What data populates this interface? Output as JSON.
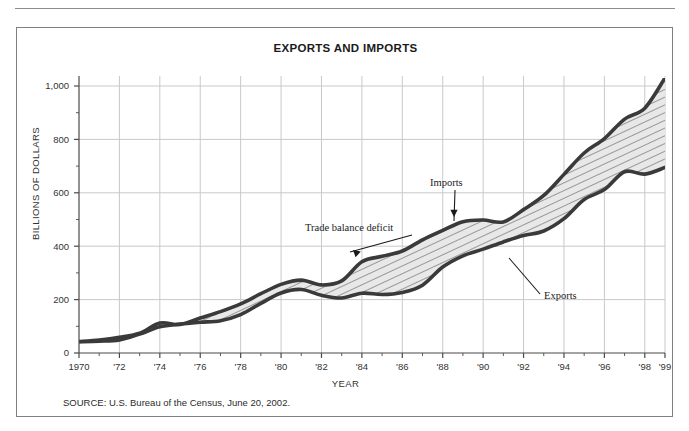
{
  "figure": {
    "title": "EXPORTS AND IMPORTS",
    "source_note": "SOURCE: U.S. Bureau of the Census, June 20, 2002."
  },
  "chart_data": {
    "type": "area",
    "title": "EXPORTS AND IMPORTS",
    "xlabel": "YEAR",
    "ylabel": "BILLIONS OF DOLLARS",
    "xlim": [
      1970,
      1999
    ],
    "ylim": [
      0,
      1000
    ],
    "grid": true,
    "legend_position": "inline-annotations",
    "x_tick_labels": [
      "1970",
      "'72",
      "'74",
      "'76",
      "'78",
      "'80",
      "'82",
      "'84",
      "'86",
      "'88",
      "'90",
      "'92",
      "'94",
      "'96",
      "'98",
      "'99"
    ],
    "x_tick_values": [
      1970,
      1972,
      1974,
      1976,
      1978,
      1980,
      1982,
      1984,
      1986,
      1988,
      1990,
      1992,
      1994,
      1996,
      1998,
      1999
    ],
    "y_tick_labels": [
      "0",
      "200",
      "400",
      "600",
      "800",
      "1,000"
    ],
    "y_tick_values": [
      0,
      200,
      400,
      600,
      800,
      1000
    ],
    "x": [
      1970,
      1971,
      1972,
      1973,
      1974,
      1975,
      1976,
      1977,
      1978,
      1979,
      1980,
      1981,
      1982,
      1983,
      1984,
      1985,
      1986,
      1987,
      1988,
      1989,
      1990,
      1991,
      1992,
      1993,
      1994,
      1995,
      1996,
      1997,
      1998,
      1999
    ],
    "series": [
      {
        "name": "Imports",
        "color": "#3a3a3a",
        "values": [
          43,
          49,
          59,
          74,
          112,
          107,
          131,
          155,
          184,
          222,
          257,
          273,
          255,
          270,
          342,
          362,
          382,
          424,
          459,
          492,
          498,
          491,
          537,
          590,
          669,
          749,
          803,
          876,
          917,
          1030
        ]
      },
      {
        "name": "Exports",
        "color": "#3a3a3a",
        "values": [
          42,
          44,
          49,
          71,
          98,
          108,
          115,
          121,
          144,
          186,
          225,
          238,
          216,
          206,
          224,
          219,
          227,
          254,
          322,
          364,
          389,
          416,
          440,
          457,
          503,
          575,
          612,
          679,
          670,
          695
        ]
      }
    ],
    "fill_label": "Trade balance deficit",
    "fill_pattern": "diagonal-hatch",
    "fill_color": "#e3e3e3",
    "annotations": [
      {
        "text": "Imports",
        "x": 1990,
        "y": 680
      },
      {
        "text": "Trade balance deficit",
        "x": 1983,
        "y": 520
      },
      {
        "text": "Exports",
        "x": 1994,
        "y": 300
      }
    ]
  },
  "axes": {
    "y_title": "BILLIONS OF DOLLARS",
    "x_title": "YEAR"
  }
}
